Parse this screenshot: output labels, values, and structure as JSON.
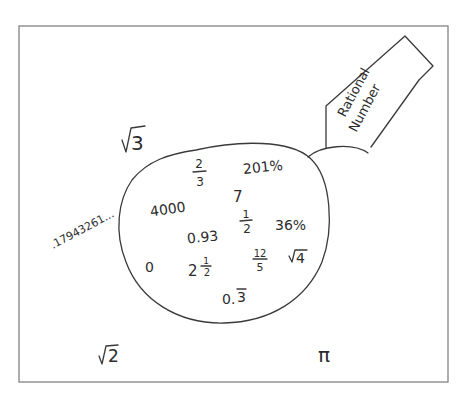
{
  "diagram": {
    "type": "set-diagram",
    "universe": {
      "label": ""
    },
    "set": {
      "name": "rational-numbers",
      "label_line1": "Rational",
      "label_line2": "Number"
    },
    "inside_items": [
      {
        "id": "two-thirds",
        "num": "2",
        "den": "3"
      },
      {
        "id": "201-percent",
        "text": "201%"
      },
      {
        "id": "seven",
        "text": "7"
      },
      {
        "id": "four-thousand",
        "text": "4000"
      },
      {
        "id": "one-half",
        "num": "1",
        "den": "2"
      },
      {
        "id": "36-percent",
        "text": "36%"
      },
      {
        "id": "zero-point-93",
        "text": "0.93"
      },
      {
        "id": "zero",
        "text": "0"
      },
      {
        "id": "two-and-a-half",
        "whole": "2",
        "num": "1",
        "den": "2"
      },
      {
        "id": "twelve-fifths",
        "num": "12",
        "den": "5"
      },
      {
        "id": "sqrt-4",
        "radicand": "4"
      },
      {
        "id": "zero-point-3-repeating",
        "prefix": "0.",
        "repeating": "3"
      }
    ],
    "outside_items": [
      {
        "id": "sqrt-3",
        "radicand": "3"
      },
      {
        "id": "non-repeating-decimal",
        "text": ".179432​61..."
      },
      {
        "id": "sqrt-2",
        "radicand": "2"
      },
      {
        "id": "pi",
        "text": "π"
      }
    ]
  }
}
